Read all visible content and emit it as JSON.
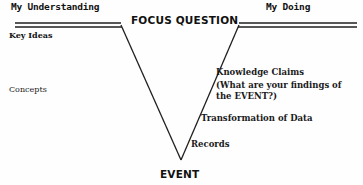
{
  "diagram": {
    "type": "vee-diagram",
    "title_center": "FOCUS QUESTION",
    "left_heading": "My Understanding",
    "right_heading": "My Doing",
    "bottom_label": "EVENT",
    "left_items": [
      {
        "label": "Key Ideas"
      },
      {
        "label": "Concepts"
      }
    ],
    "right_items": [
      {
        "label": "Knowledge Claims"
      },
      {
        "label": "(What are your findings of the EVENT?)"
      },
      {
        "label": "Transformation of Data"
      },
      {
        "label": "Records"
      }
    ],
    "colors": {
      "background": "#fefefe",
      "stroke": "#1f1f1f",
      "text": "#1a1a1a"
    },
    "geometry": {
      "left_rule_start_x": 15,
      "left_rule_end_x": 120,
      "right_rule_start_x": 239,
      "right_rule_end_x": 356,
      "rule_y": 24,
      "vertex_x": 181,
      "vertex_y": 160
    }
  }
}
